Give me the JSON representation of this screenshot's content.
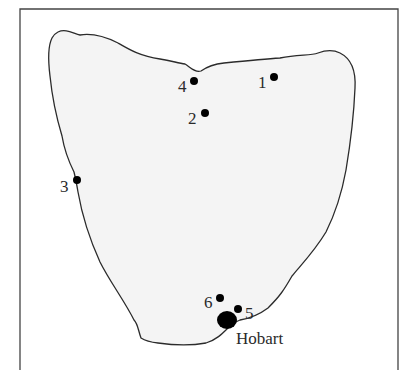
{
  "map": {
    "region": "Tasmania",
    "colors": {
      "land": "#f4f4f4",
      "outline": "#2b2b2b",
      "frame": "#444444",
      "marker": "#000000",
      "text": "#2a2a2a"
    },
    "sites": [
      {
        "id": "1",
        "label": "1",
        "x": 274,
        "y": 77
      },
      {
        "id": "2",
        "label": "2",
        "x": 205,
        "y": 113
      },
      {
        "id": "3",
        "label": "3",
        "x": 77,
        "y": 180
      },
      {
        "id": "4",
        "label": "4",
        "x": 194,
        "y": 81
      },
      {
        "id": "5",
        "label": "5",
        "x": 238,
        "y": 309
      },
      {
        "id": "6",
        "label": "6",
        "x": 220,
        "y": 298
      }
    ],
    "city": {
      "label": "Hobart",
      "x": 226,
      "y": 319
    }
  }
}
